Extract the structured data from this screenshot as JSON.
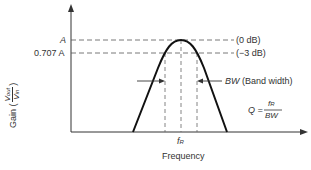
{
  "diagram": {
    "y_axis": {
      "label_prefix": "Gain (",
      "label_suffix": ")",
      "frac_num": "V",
      "frac_num_sub": "out",
      "frac_den": "V",
      "frac_den_sub": "in"
    },
    "x_axis": {
      "label": "Frequency"
    },
    "levels": [
      {
        "name": "A",
        "label": "A",
        "note": "(0 dB)"
      },
      {
        "name": "0.707A",
        "label": "0.707 A",
        "note": "(−3 dB)"
      }
    ],
    "center_freq": {
      "label": "f",
      "sub": "R"
    },
    "bandwidth": {
      "abbr": "BW",
      "text": " (Band width)"
    },
    "q_formula": {
      "lhs": "Q =",
      "num": "f",
      "num_sub": "R",
      "den": "BW"
    }
  }
}
